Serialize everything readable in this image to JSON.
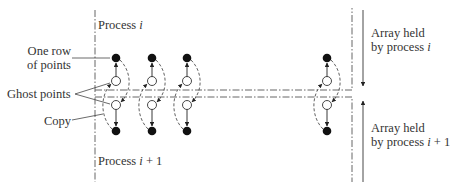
{
  "labels": {
    "process_top": "Process ",
    "process_top_var": "i",
    "process_bottom": "Process ",
    "process_bottom_var": "i",
    "process_bottom_suffix": " + 1",
    "one_row_line1": "One row",
    "one_row_line2": "of points",
    "ghost_points": "Ghost points",
    "copy": "Copy",
    "array_top_line1": "Array held",
    "array_top_line2": "by process ",
    "array_top_var": "i",
    "array_bottom_line1": "Array held",
    "array_bottom_line2": "by process ",
    "array_bottom_var": "i",
    "array_bottom_suffix": " + 1"
  },
  "columns_x": [
    116,
    152,
    187,
    327
  ],
  "points": {
    "top_filled_y": 58,
    "ghost_upper_y": 81,
    "ghost_lower_y": 105,
    "bottom_filled_y": 131
  },
  "boundaries": {
    "upper_y": 90,
    "lower_y": 97,
    "left_x": 95,
    "right_x": 352,
    "arrow_x": 363
  },
  "colors": {
    "line": "#444444",
    "point_fill": "#111111",
    "text": "#333333"
  }
}
